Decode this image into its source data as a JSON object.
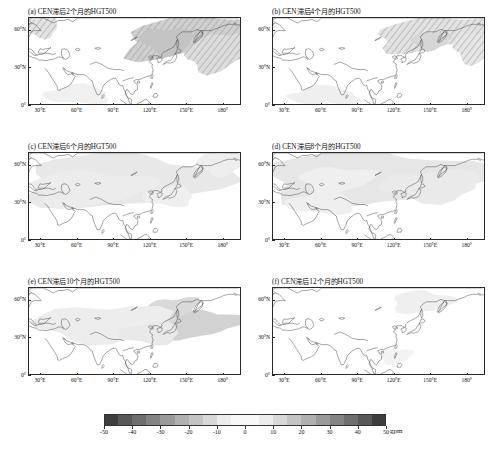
{
  "figure": {
    "panel_count": 6,
    "variable": "HGT500",
    "unit_label": "gpm"
  },
  "panels": [
    {
      "id": "a",
      "title": "(a) CEN滞后2个月的HGT500",
      "lag_months": 2
    },
    {
      "id": "b",
      "title": "(b) CEN滞后4个月的HGT500",
      "lag_months": 4
    },
    {
      "id": "c",
      "title": "(c) CEN滞后6个月的HGT500",
      "lag_months": 6
    },
    {
      "id": "d",
      "title": "(d) CEN滞后8个月的HGT500",
      "lag_months": 8
    },
    {
      "id": "e",
      "title": "(e) CEN滞后10个月的HGT500",
      "lag_months": 10
    },
    {
      "id": "f",
      "title": "(f) CEN滞后12个月的HGT500",
      "lag_months": 12
    }
  ],
  "axes": {
    "xticks": [
      "30°E",
      "60°E",
      "90°E",
      "120°E",
      "150°E",
      "180°"
    ],
    "xvalues": [
      30,
      60,
      90,
      120,
      150,
      180
    ],
    "yticks": [
      "60°N",
      "30°N",
      "0°"
    ],
    "yvalues": [
      60,
      30,
      0
    ],
    "xlim": [
      20,
      195
    ],
    "ylim": [
      0,
      70
    ]
  },
  "colorbar": {
    "ticks": [
      "-50",
      "-40",
      "-30",
      "-20",
      "-10",
      "0",
      "10",
      "20",
      "30",
      "40",
      "50"
    ],
    "tick_values": [
      -50,
      -40,
      -30,
      -20,
      -10,
      0,
      10,
      20,
      30,
      40,
      50
    ],
    "unit": "gpm",
    "orientation": "horizontal",
    "colors": [
      "#3d3d3d",
      "#585858",
      "#6e6e6e",
      "#848484",
      "#9a9a9a",
      "#b0b0b0",
      "#c4c4c4",
      "#d8d8d8",
      "#ececec",
      "#f8f8f8",
      "#f8f8f8",
      "#ececec",
      "#d8d8d8",
      "#c4c4c4",
      "#b0b0b0",
      "#9a9a9a",
      "#848484",
      "#6e6e6e",
      "#585858",
      "#3d3d3d"
    ]
  },
  "chart_data": {
    "type": "heatmap",
    "xlabel": "",
    "ylabel": "",
    "unit": "gpm",
    "xlim": [
      20,
      195
    ],
    "ylim": [
      0,
      70
    ],
    "grid": false,
    "legend_position": "bottom",
    "colorbar_range": [
      -50,
      50
    ],
    "colorbar_step": 5,
    "panels": [
      {
        "id": "a",
        "title": "(a) CEN滞后2个月的HGT500",
        "features": [
          {
            "kind": "shaded-anomaly",
            "center_lon": 140,
            "center_lat": 55,
            "value": 20,
            "extent_lon": [
              110,
              195
            ],
            "extent_lat": [
              38,
              70
            ],
            "hatched": true
          },
          {
            "kind": "shaded-anomaly",
            "center_lon": 175,
            "center_lat": 45,
            "value": 15,
            "extent_lon": [
              150,
              195
            ],
            "extent_lat": [
              30,
              58
            ],
            "hatched": true
          },
          {
            "kind": "shaded-anomaly",
            "center_lon": 30,
            "center_lat": 62,
            "value": 10,
            "extent_lon": [
              20,
              45
            ],
            "extent_lat": [
              50,
              70
            ],
            "hatched": true
          }
        ]
      },
      {
        "id": "b",
        "title": "(b) CEN滞后4个月的HGT500",
        "features": [
          {
            "kind": "shaded-anomaly",
            "center_lon": 150,
            "center_lat": 55,
            "value": 12,
            "extent_lon": [
              105,
              195
            ],
            "extent_lat": [
              40,
              70
            ],
            "hatched": true
          },
          {
            "kind": "shaded-anomaly",
            "center_lon": 60,
            "center_lat": 8,
            "value": 8,
            "extent_lon": [
              35,
              95
            ],
            "extent_lat": [
              0,
              18
            ],
            "hatched": false
          }
        ]
      },
      {
        "id": "c",
        "title": "(c) CEN滞后6个月的HGT500",
        "features": [
          {
            "kind": "shaded-anomaly",
            "center_lon": 85,
            "center_lat": 45,
            "value": 14,
            "extent_lon": [
              20,
              150
            ],
            "extent_lat": [
              25,
              70
            ],
            "hatched": false
          },
          {
            "kind": "shaded-anomaly",
            "center_lon": 175,
            "center_lat": 60,
            "value": 6,
            "extent_lon": [
              155,
              195
            ],
            "extent_lat": [
              48,
              70
            ],
            "hatched": false
          }
        ]
      },
      {
        "id": "d",
        "title": "(d) CEN滞后8个月的HGT500",
        "features": [
          {
            "kind": "shaded-anomaly",
            "center_lon": 90,
            "center_lat": 48,
            "value": 16,
            "extent_lon": [
              20,
              195
            ],
            "extent_lat": [
              28,
              70
            ],
            "hatched": false
          },
          {
            "kind": "shaded-anomaly",
            "center_lon": 70,
            "center_lat": 48,
            "value": 8,
            "extent_lon": [
              50,
              100
            ],
            "extent_lat": [
              40,
              58
            ],
            "hatched": false
          }
        ]
      },
      {
        "id": "e",
        "title": "(e) CEN滞后10个月的HGT500",
        "features": [
          {
            "kind": "shaded-anomaly",
            "center_lon": 155,
            "center_lat": 42,
            "value": 18,
            "extent_lon": [
              125,
              195
            ],
            "extent_lat": [
              28,
              55
            ],
            "hatched": false
          },
          {
            "kind": "shaded-anomaly",
            "center_lon": 135,
            "center_lat": 52,
            "value": 12,
            "extent_lon": [
              115,
              160
            ],
            "extent_lat": [
              42,
              62
            ],
            "hatched": false
          },
          {
            "kind": "shaded-anomaly",
            "center_lon": 70,
            "center_lat": 42,
            "value": 8,
            "extent_lon": [
              30,
              120
            ],
            "extent_lat": [
              28,
              60
            ],
            "hatched": false
          }
        ]
      },
      {
        "id": "f",
        "title": "(f) CEN滞后12个月的HGT500",
        "features": [
          {
            "kind": "shaded-anomaly",
            "center_lon": 140,
            "center_lat": 58,
            "value": 5,
            "extent_lon": [
              120,
              165
            ],
            "extent_lat": [
              48,
              68
            ],
            "hatched": false
          }
        ]
      }
    ]
  }
}
